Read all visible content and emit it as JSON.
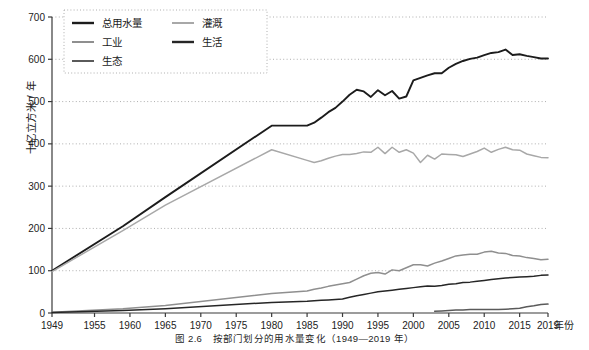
{
  "figure": {
    "caption": "图 2.6　按部门划分的用水量变化（1949—2019 年）",
    "y_axis_title": "十亿立方米 / 年",
    "x_axis_unit": "年份"
  },
  "legend": {
    "items": [
      {
        "label": "总用水量",
        "color": "#1c1c1c"
      },
      {
        "label": "灌溉",
        "color": "#a8a8a8"
      },
      {
        "label": "工业",
        "color": "#8f8f8f"
      },
      {
        "label": "生活",
        "color": "#262626"
      },
      {
        "label": "生态",
        "color": "#5a5a5a"
      }
    ]
  },
  "axis": {
    "y_ticks": [
      "0",
      "100",
      "200",
      "300",
      "400",
      "500",
      "600",
      "700"
    ],
    "x_ticks": [
      "1949",
      "1955",
      "1960",
      "1965",
      "1970",
      "1975",
      "1980",
      "1985",
      "1990",
      "1995",
      "2000",
      "2005",
      "2010",
      "2015",
      "2019"
    ]
  },
  "chart_data": {
    "type": "line",
    "title": "图 2.6　按部门划分的用水量变化（1949—2019 年）",
    "xlabel": "年份",
    "ylabel": "十亿立方米 / 年",
    "xlim": [
      1949,
      2019
    ],
    "ylim": [
      0,
      700
    ],
    "grid": "horizontal-dotted",
    "legend_position": "top-left",
    "x_ticks": [
      1949,
      1955,
      1960,
      1965,
      1970,
      1975,
      1980,
      1985,
      1990,
      1995,
      2000,
      2005,
      2010,
      2015,
      2019
    ],
    "y_ticks": [
      0,
      100,
      200,
      300,
      400,
      500,
      600,
      700
    ],
    "series": [
      {
        "name": "总用水量",
        "color": "#1c1c1c",
        "points": [
          [
            1949,
            100
          ],
          [
            1959,
            205
          ],
          [
            1965,
            274
          ],
          [
            1980,
            443
          ],
          [
            1985,
            443
          ],
          [
            1986,
            450
          ],
          [
            1987,
            462
          ],
          [
            1988,
            475
          ],
          [
            1989,
            485
          ],
          [
            1990,
            500
          ],
          [
            1991,
            516
          ],
          [
            1992,
            528
          ],
          [
            1993,
            524
          ],
          [
            1994,
            511
          ],
          [
            1995,
            527
          ],
          [
            1996,
            515
          ],
          [
            1997,
            525
          ],
          [
            1998,
            507
          ],
          [
            1999,
            512
          ],
          [
            2000,
            550
          ],
          [
            2001,
            556
          ],
          [
            2002,
            562
          ],
          [
            2003,
            567
          ],
          [
            2004,
            567
          ],
          [
            2005,
            580
          ],
          [
            2006,
            589
          ],
          [
            2007,
            596
          ],
          [
            2008,
            601
          ],
          [
            2009,
            604
          ],
          [
            2010,
            610
          ],
          [
            2011,
            615
          ],
          [
            2012,
            617
          ],
          [
            2013,
            623
          ],
          [
            2014,
            610
          ],
          [
            2015,
            612
          ],
          [
            2016,
            608
          ],
          [
            2017,
            605
          ],
          [
            2018,
            602
          ],
          [
            2019,
            602
          ]
        ]
      },
      {
        "name": "灌溉",
        "color": "#a8a8a8",
        "points": [
          [
            1949,
            98
          ],
          [
            1959,
            195
          ],
          [
            1965,
            255
          ],
          [
            1980,
            386
          ],
          [
            1985,
            361
          ],
          [
            1986,
            356
          ],
          [
            1987,
            360
          ],
          [
            1988,
            366
          ],
          [
            1989,
            371
          ],
          [
            1990,
            375
          ],
          [
            1991,
            375
          ],
          [
            1992,
            377
          ],
          [
            1993,
            381
          ],
          [
            1994,
            380
          ],
          [
            1995,
            392
          ],
          [
            1996,
            377
          ],
          [
            1997,
            392
          ],
          [
            1998,
            380
          ],
          [
            1999,
            386
          ],
          [
            2000,
            378
          ],
          [
            2001,
            356
          ],
          [
            2002,
            373
          ],
          [
            2003,
            364
          ],
          [
            2004,
            376
          ],
          [
            2005,
            375
          ],
          [
            2006,
            374
          ],
          [
            2007,
            370
          ],
          [
            2008,
            376
          ],
          [
            2009,
            382
          ],
          [
            2010,
            390
          ],
          [
            2011,
            380
          ],
          [
            2012,
            387
          ],
          [
            2013,
            392
          ],
          [
            2014,
            386
          ],
          [
            2015,
            385
          ],
          [
            2016,
            376
          ],
          [
            2017,
            372
          ],
          [
            2018,
            368
          ],
          [
            2019,
            367
          ]
        ]
      },
      {
        "name": "工业",
        "color": "#8f8f8f",
        "points": [
          [
            1949,
            2
          ],
          [
            1959,
            10
          ],
          [
            1965,
            18
          ],
          [
            1980,
            46
          ],
          [
            1985,
            52
          ],
          [
            1986,
            56
          ],
          [
            1987,
            59
          ],
          [
            1988,
            63
          ],
          [
            1989,
            66
          ],
          [
            1990,
            69
          ],
          [
            1991,
            72
          ],
          [
            1992,
            80
          ],
          [
            1993,
            88
          ],
          [
            1994,
            94
          ],
          [
            1995,
            96
          ],
          [
            1996,
            92
          ],
          [
            1997,
            102
          ],
          [
            1998,
            100
          ],
          [
            1999,
            107
          ],
          [
            2000,
            114
          ],
          [
            2001,
            114
          ],
          [
            2002,
            111
          ],
          [
            2003,
            118
          ],
          [
            2004,
            123
          ],
          [
            2005,
            129
          ],
          [
            2006,
            135
          ],
          [
            2007,
            137
          ],
          [
            2008,
            139
          ],
          [
            2009,
            139
          ],
          [
            2010,
            144
          ],
          [
            2011,
            146
          ],
          [
            2012,
            142
          ],
          [
            2013,
            141
          ],
          [
            2014,
            136
          ],
          [
            2015,
            135
          ],
          [
            2016,
            131
          ],
          [
            2017,
            129
          ],
          [
            2018,
            126
          ],
          [
            2019,
            127
          ]
        ]
      },
      {
        "name": "生活",
        "color": "#262626",
        "points": [
          [
            1949,
            1
          ],
          [
            1959,
            6
          ],
          [
            1965,
            10
          ],
          [
            1980,
            25
          ],
          [
            1985,
            28
          ],
          [
            1986,
            29
          ],
          [
            1987,
            30
          ],
          [
            1988,
            31
          ],
          [
            1989,
            32
          ],
          [
            1990,
            33
          ],
          [
            1991,
            37
          ],
          [
            1992,
            41
          ],
          [
            1993,
            44
          ],
          [
            1994,
            47
          ],
          [
            1995,
            50
          ],
          [
            1996,
            52
          ],
          [
            1997,
            54
          ],
          [
            1998,
            56
          ],
          [
            1999,
            58
          ],
          [
            2000,
            60
          ],
          [
            2001,
            62
          ],
          [
            2002,
            64
          ],
          [
            2003,
            63
          ],
          [
            2004,
            65
          ],
          [
            2005,
            68
          ],
          [
            2006,
            69
          ],
          [
            2007,
            72
          ],
          [
            2008,
            73
          ],
          [
            2009,
            75
          ],
          [
            2010,
            77
          ],
          [
            2011,
            79
          ],
          [
            2012,
            81
          ],
          [
            2013,
            83
          ],
          [
            2014,
            84
          ],
          [
            2015,
            85
          ],
          [
            2016,
            86
          ],
          [
            2017,
            87
          ],
          [
            2018,
            89
          ],
          [
            2019,
            90
          ]
        ]
      },
      {
        "name": "生态",
        "color": "#5a5a5a",
        "points": [
          [
            2003,
            4
          ],
          [
            2004,
            5
          ],
          [
            2005,
            6
          ],
          [
            2006,
            7
          ],
          [
            2007,
            7
          ],
          [
            2008,
            8
          ],
          [
            2009,
            8
          ],
          [
            2010,
            8
          ],
          [
            2011,
            8
          ],
          [
            2012,
            8
          ],
          [
            2013,
            9
          ],
          [
            2014,
            10
          ],
          [
            2015,
            11
          ],
          [
            2016,
            15
          ],
          [
            2017,
            17
          ],
          [
            2018,
            20
          ],
          [
            2019,
            21
          ]
        ]
      }
    ]
  }
}
